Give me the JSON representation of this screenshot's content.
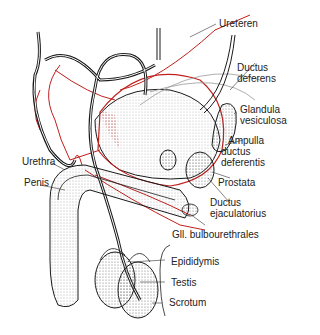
{
  "diagram": {
    "colors": {
      "outline": "#1a1a1a",
      "vessel": "#c0201c",
      "label": "#222222",
      "background": "#ffffff"
    },
    "labels": [
      {
        "id": "ureteren",
        "text": "Ureteren"
      },
      {
        "id": "ductus-deferens-1",
        "text": "Ductus"
      },
      {
        "id": "ductus-deferens-2",
        "text": "deferens"
      },
      {
        "id": "glandula-1",
        "text": "Glandula"
      },
      {
        "id": "glandula-2",
        "text": "vesiculosa"
      },
      {
        "id": "ampulla-1",
        "text": "Ampulla"
      },
      {
        "id": "ampulla-2",
        "text": "ductus"
      },
      {
        "id": "ampulla-3",
        "text": "deferentis"
      },
      {
        "id": "urethra",
        "text": "Urethra"
      },
      {
        "id": "penis",
        "text": "Penis"
      },
      {
        "id": "prostata",
        "text": "Prostata"
      },
      {
        "id": "ejac-1",
        "text": "Ductus"
      },
      {
        "id": "ejac-2",
        "text": "ejaculatorius"
      },
      {
        "id": "bulbo",
        "text": "Gll. bulbourethrales"
      },
      {
        "id": "epididymis",
        "text": "Epididymis"
      },
      {
        "id": "testis",
        "text": "Testis"
      },
      {
        "id": "scrotum",
        "text": "Scrotum"
      }
    ]
  }
}
